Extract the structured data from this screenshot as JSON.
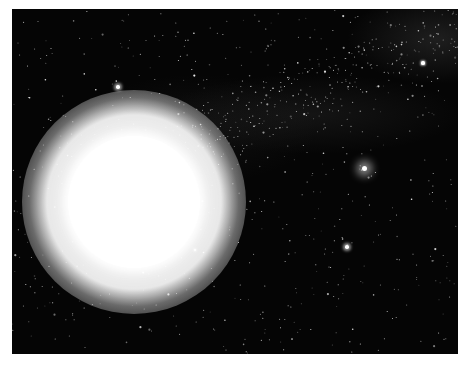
{
  "scene": {
    "description": "Star field with a bright overexposed sun on the left, a bright star on the right, and a faint Milky Way band in the upper right",
    "frame": {
      "x": 12,
      "y": 9,
      "width": 446,
      "height": 345
    },
    "colors": {
      "sky": "#050505",
      "border": "#ffffff",
      "star": "#ffffff"
    },
    "sun": {
      "cx": 122,
      "cy": 193,
      "radius": 66,
      "glow_radius": 112
    },
    "bright_stars": [
      {
        "name": "right-bright-star",
        "cx": 352,
        "cy": 159,
        "r": 2.5,
        "glow": 9
      },
      {
        "name": "upper-left-star",
        "cx": 106,
        "cy": 78,
        "r": 1.8,
        "glow": 3
      },
      {
        "name": "lower-right-star",
        "cx": 335,
        "cy": 238,
        "r": 1.8,
        "glow": 3
      },
      {
        "name": "upper-right-star",
        "cx": 411,
        "cy": 54,
        "r": 1.6,
        "glow": 2
      },
      {
        "name": "near-sun-star",
        "cx": 183,
        "cy": 241,
        "r": 1.4,
        "glow": 2
      }
    ],
    "dust_star_count": 900
  }
}
